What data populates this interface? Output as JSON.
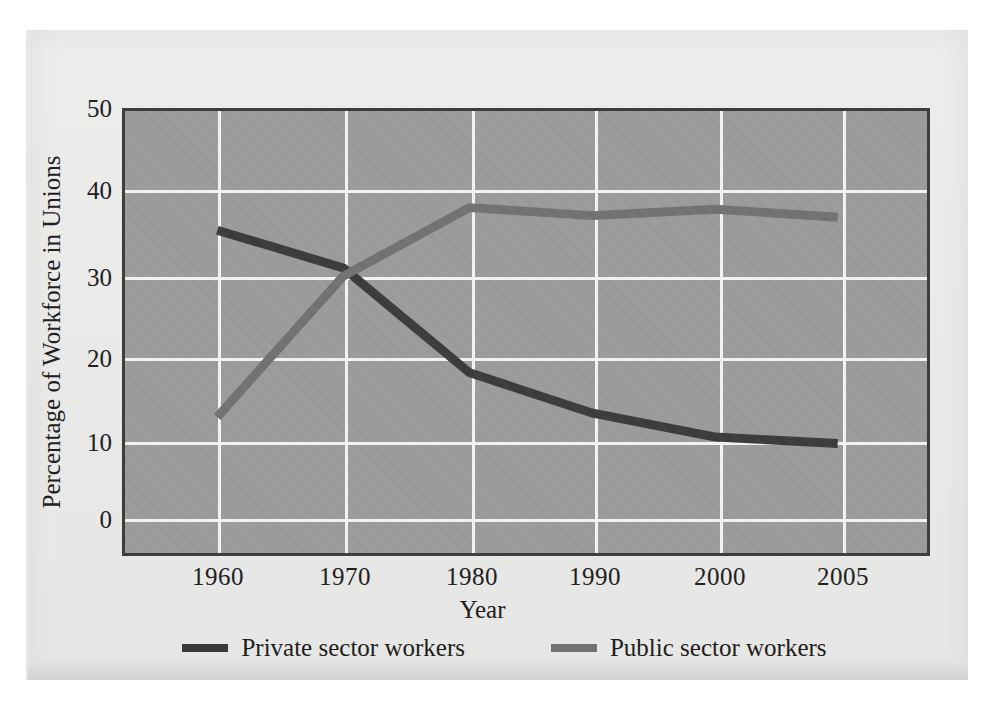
{
  "figure": {
    "background_color": "#e9e9e7",
    "page_color": "#ffffff"
  },
  "chart_data": {
    "type": "line",
    "title": "",
    "xlabel": "Year",
    "ylabel": "Percentage of Workforce in Unions",
    "categories": [
      "1960",
      "1970",
      "1980",
      "1990",
      "2000",
      "2005"
    ],
    "x": [
      1960,
      1970,
      1980,
      1990,
      2000,
      2005
    ],
    "series": [
      {
        "name": "Private sector workers",
        "color": "#3a3a3a",
        "values": [
          35.2,
          30.5,
          17.5,
          12.5,
          9.5,
          8.7
        ]
      },
      {
        "name": "Public sector workers",
        "color": "#717171",
        "values": [
          12.0,
          29.5,
          38.0,
          37.0,
          37.8,
          36.8
        ]
      }
    ],
    "xlim": [
      1960,
      2005
    ],
    "ylim": [
      0,
      50
    ],
    "yticks": [
      "0",
      "10",
      "20",
      "30",
      "40",
      "50"
    ],
    "ytick_values": [
      0,
      10,
      20,
      30,
      40,
      50
    ],
    "xticks": [
      "1960",
      "1970",
      "1980",
      "1990",
      "2000",
      "2005"
    ],
    "grid": true,
    "grid_color": "#f4f4f2",
    "plot_background": "#9b9b9b",
    "legend_position": "below",
    "legend": [
      "Private sector workers",
      "Public sector workers"
    ]
  },
  "legend": {
    "entries": [
      {
        "label": "Private sector workers",
        "swatch": "private"
      },
      {
        "label": "Public sector workers",
        "swatch": "public"
      }
    ]
  },
  "axes": {
    "x_title": "Year",
    "y_title": "Percentage of Workforce in Unions"
  }
}
